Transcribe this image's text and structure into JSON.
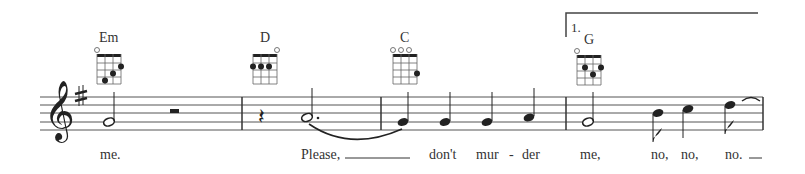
{
  "score": {
    "clef": "treble",
    "key_signature": "G major (1 sharp)",
    "volta": {
      "label": "1."
    },
    "measures": [
      {
        "chord": {
          "name": "Em",
          "open": [
            1
          ],
          "dots": [
            [
              2,
              4
            ],
            [
              3,
              3
            ],
            [
              4,
              2
            ]
          ]
        },
        "notes": [
          "G4 half",
          "half rest"
        ],
        "lyrics": [
          "me."
        ]
      },
      {
        "chord": {
          "name": "D",
          "open": [
            4
          ],
          "dots": [
            [
              1,
              2
            ],
            [
              2,
              2
            ],
            [
              3,
              2
            ]
          ]
        },
        "notes": [
          "quarter rest",
          "A4 dotted half (tied)"
        ],
        "lyrics": [
          "Please,"
        ]
      },
      {
        "chord": {
          "name": "C",
          "open": [
            1,
            2,
            3
          ],
          "dots": [
            [
              4,
              3
            ]
          ]
        },
        "notes": [
          "G4 quarter",
          "G4 quarter",
          "G4 quarter",
          "A4 quarter"
        ],
        "lyrics": [
          "don't",
          "mur",
          "-",
          "der"
        ]
      },
      {
        "chord": {
          "name": "G",
          "open": [
            1
          ],
          "dots": [
            [
              2,
              2
            ],
            [
              3,
              3
            ],
            [
              4,
              2
            ]
          ]
        },
        "notes": [
          "G4 half",
          "B4 eighth",
          "C5 quarter",
          "D5 eighth (tied)"
        ],
        "lyrics": [
          "me,",
          "no,",
          "no,",
          "no."
        ]
      }
    ]
  },
  "chords": {
    "em": "Em",
    "d": "D",
    "c": "C",
    "g": "G"
  },
  "lyrics": {
    "w1": "me.",
    "w2": "Please,",
    "w3": "don't",
    "w4": "mur",
    "w5": "-",
    "w6": "der",
    "w7": "me,",
    "w8": "no,",
    "w9": "no,",
    "w10": "no."
  },
  "volta_label": "1."
}
